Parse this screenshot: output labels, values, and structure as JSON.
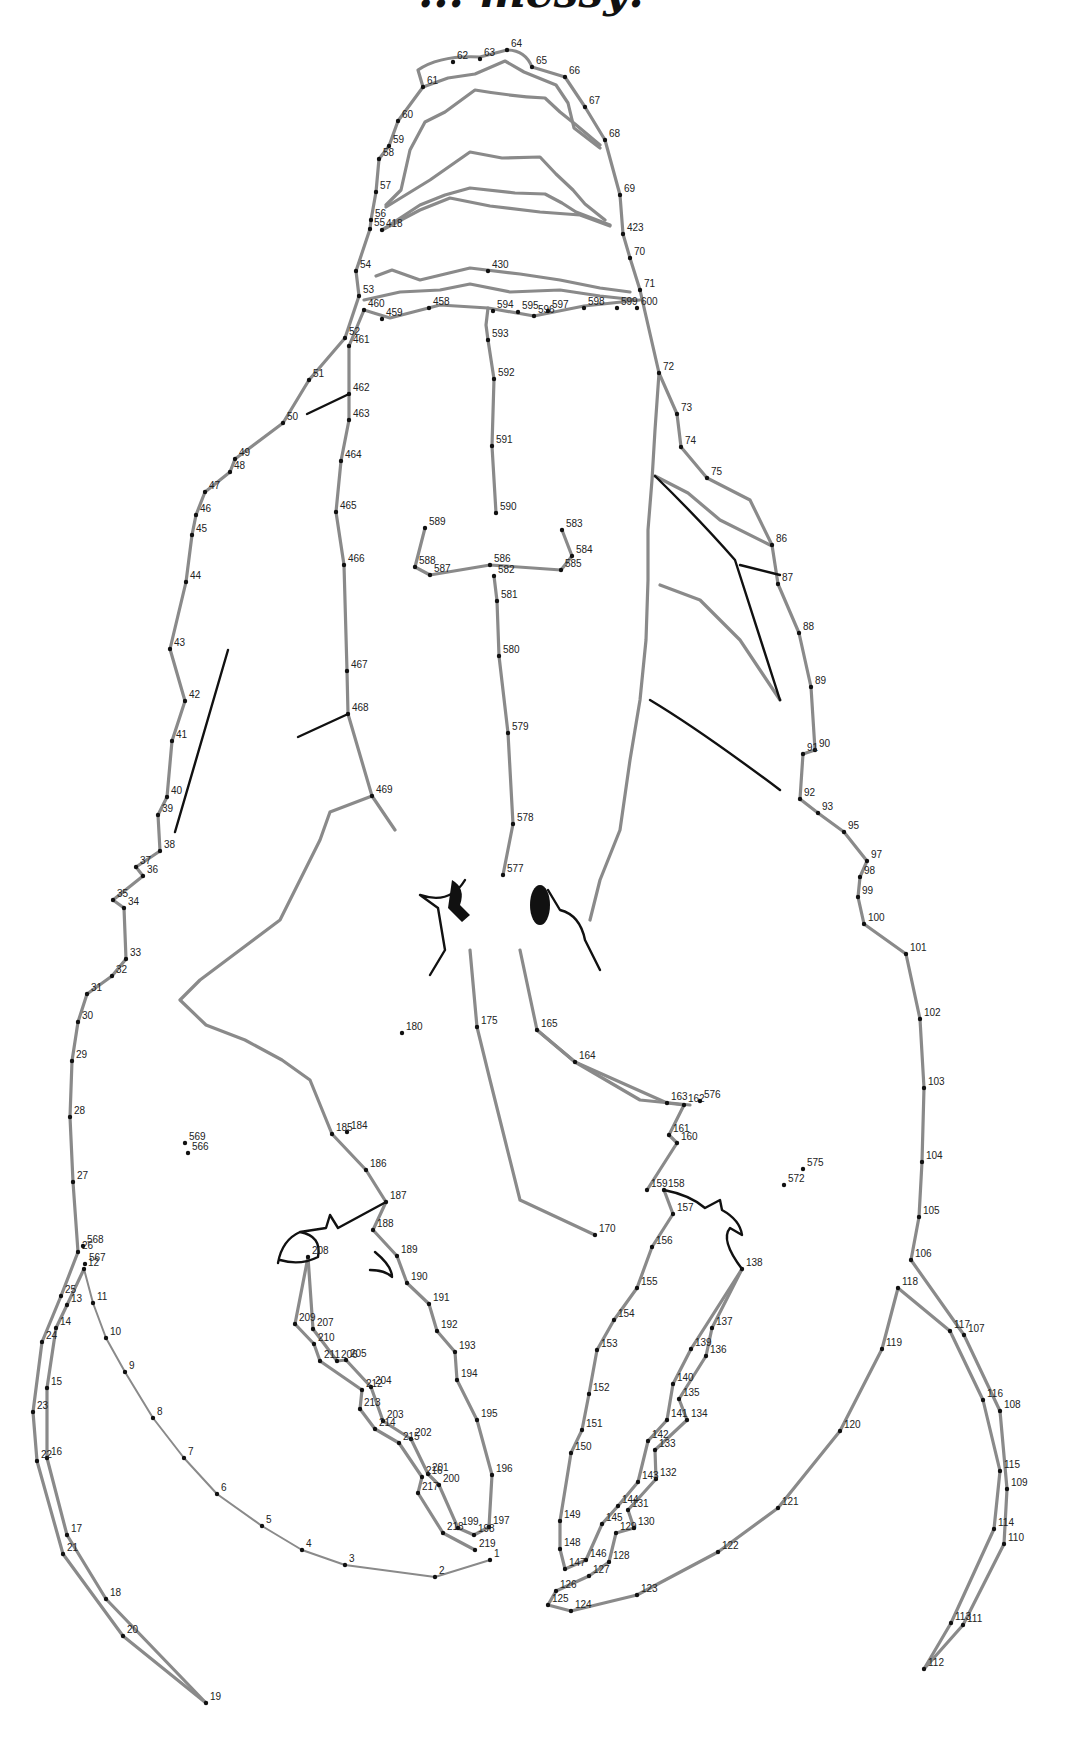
{
  "title": "... messy!",
  "colors": {
    "outline": "#8a8a8a",
    "ink": "#111111",
    "background": "#ffffff"
  },
  "dots": [
    {
      "n": "1",
      "x": 490,
      "y": 1560
    },
    {
      "n": "2",
      "x": 435,
      "y": 1577
    },
    {
      "n": "3",
      "x": 345,
      "y": 1565
    },
    {
      "n": "4",
      "x": 302,
      "y": 1550
    },
    {
      "n": "5",
      "x": 262,
      "y": 1526
    },
    {
      "n": "6",
      "x": 217,
      "y": 1494
    },
    {
      "n": "7",
      "x": 184,
      "y": 1458
    },
    {
      "n": "8",
      "x": 153,
      "y": 1418
    },
    {
      "n": "9",
      "x": 125,
      "y": 1372
    },
    {
      "n": "10",
      "x": 106,
      "y": 1338
    },
    {
      "n": "11",
      "x": 93,
      "y": 1303
    },
    {
      "n": "12",
      "x": 84,
      "y": 1269
    },
    {
      "n": "13",
      "x": 67,
      "y": 1305
    },
    {
      "n": "14",
      "x": 56,
      "y": 1328
    },
    {
      "n": "15",
      "x": 47,
      "y": 1388
    },
    {
      "n": "16",
      "x": 47,
      "y": 1458
    },
    {
      "n": "17",
      "x": 67,
      "y": 1535
    },
    {
      "n": "18",
      "x": 106,
      "y": 1599
    },
    {
      "n": "19",
      "x": 206,
      "y": 1703
    },
    {
      "n": "20",
      "x": 123,
      "y": 1636
    },
    {
      "n": "21",
      "x": 63,
      "y": 1554
    },
    {
      "n": "22",
      "x": 37,
      "y": 1461
    },
    {
      "n": "23",
      "x": 33,
      "y": 1412
    },
    {
      "n": "24",
      "x": 42,
      "y": 1342
    },
    {
      "n": "25",
      "x": 61,
      "y": 1296
    },
    {
      "n": "26",
      "x": 78,
      "y": 1252
    },
    {
      "n": "27",
      "x": 73,
      "y": 1182
    },
    {
      "n": "28",
      "x": 70,
      "y": 1117
    },
    {
      "n": "29",
      "x": 72,
      "y": 1061
    },
    {
      "n": "30",
      "x": 78,
      "y": 1022
    },
    {
      "n": "31",
      "x": 87,
      "y": 994
    },
    {
      "n": "32",
      "x": 112,
      "y": 976
    },
    {
      "n": "33",
      "x": 126,
      "y": 959
    },
    {
      "n": "34",
      "x": 124,
      "y": 908
    },
    {
      "n": "35",
      "x": 113,
      "y": 900
    },
    {
      "n": "36",
      "x": 143,
      "y": 876
    },
    {
      "n": "37",
      "x": 136,
      "y": 867
    },
    {
      "n": "38",
      "x": 160,
      "y": 851
    },
    {
      "n": "39",
      "x": 158,
      "y": 815
    },
    {
      "n": "40",
      "x": 167,
      "y": 797
    },
    {
      "n": "41",
      "x": 172,
      "y": 741
    },
    {
      "n": "42",
      "x": 185,
      "y": 701
    },
    {
      "n": "43",
      "x": 170,
      "y": 649
    },
    {
      "n": "44",
      "x": 186,
      "y": 582
    },
    {
      "n": "45",
      "x": 192,
      "y": 535
    },
    {
      "n": "46",
      "x": 196,
      "y": 515
    },
    {
      "n": "47",
      "x": 205,
      "y": 492
    },
    {
      "n": "48",
      "x": 230,
      "y": 472
    },
    {
      "n": "49",
      "x": 235,
      "y": 459
    },
    {
      "n": "50",
      "x": 283,
      "y": 423
    },
    {
      "n": "51",
      "x": 309,
      "y": 380
    },
    {
      "n": "52",
      "x": 345,
      "y": 338
    },
    {
      "n": "53",
      "x": 359,
      "y": 296
    },
    {
      "n": "54",
      "x": 356,
      "y": 271
    },
    {
      "n": "55",
      "x": 370,
      "y": 229
    },
    {
      "n": "56",
      "x": 371,
      "y": 220
    },
    {
      "n": "57",
      "x": 376,
      "y": 192
    },
    {
      "n": "58",
      "x": 379,
      "y": 159
    },
    {
      "n": "59",
      "x": 389,
      "y": 146
    },
    {
      "n": "60",
      "x": 398,
      "y": 121
    },
    {
      "n": "61",
      "x": 423,
      "y": 87
    },
    {
      "n": "62",
      "x": 453,
      "y": 62
    },
    {
      "n": "63",
      "x": 480,
      "y": 59
    },
    {
      "n": "64",
      "x": 507,
      "y": 50
    },
    {
      "n": "65",
      "x": 532,
      "y": 67
    },
    {
      "n": "66",
      "x": 565,
      "y": 77
    },
    {
      "n": "67",
      "x": 585,
      "y": 107
    },
    {
      "n": "68",
      "x": 605,
      "y": 140
    },
    {
      "n": "69",
      "x": 620,
      "y": 195
    },
    {
      "n": "70",
      "x": 630,
      "y": 258
    },
    {
      "n": "71",
      "x": 640,
      "y": 290
    },
    {
      "n": "72",
      "x": 659,
      "y": 373
    },
    {
      "n": "73",
      "x": 677,
      "y": 414
    },
    {
      "n": "74",
      "x": 681,
      "y": 447
    },
    {
      "n": "75",
      "x": 707,
      "y": 478
    },
    {
      "n": "86",
      "x": 772,
      "y": 545
    },
    {
      "n": "87",
      "x": 778,
      "y": 584
    },
    {
      "n": "88",
      "x": 799,
      "y": 633
    },
    {
      "n": "89",
      "x": 811,
      "y": 687
    },
    {
      "n": "90",
      "x": 815,
      "y": 750
    },
    {
      "n": "91",
      "x": 803,
      "y": 754
    },
    {
      "n": "92",
      "x": 800,
      "y": 799
    },
    {
      "n": "93",
      "x": 818,
      "y": 813
    },
    {
      "n": "95",
      "x": 844,
      "y": 832
    },
    {
      "n": "97",
      "x": 867,
      "y": 861
    },
    {
      "n": "98",
      "x": 860,
      "y": 877
    },
    {
      "n": "99",
      "x": 858,
      "y": 897
    },
    {
      "n": "100",
      "x": 864,
      "y": 924
    },
    {
      "n": "101",
      "x": 906,
      "y": 954
    },
    {
      "n": "102",
      "x": 920,
      "y": 1019
    },
    {
      "n": "103",
      "x": 924,
      "y": 1088
    },
    {
      "n": "104",
      "x": 922,
      "y": 1162
    },
    {
      "n": "105",
      "x": 919,
      "y": 1217
    },
    {
      "n": "106",
      "x": 911,
      "y": 1260
    },
    {
      "n": "107",
      "x": 964,
      "y": 1335
    },
    {
      "n": "108",
      "x": 1000,
      "y": 1411
    },
    {
      "n": "109",
      "x": 1007,
      "y": 1489
    },
    {
      "n": "110",
      "x": 1004,
      "y": 1544
    },
    {
      "n": "111",
      "x": 963,
      "y": 1625
    },
    {
      "n": "112",
      "x": 924,
      "y": 1669
    },
    {
      "n": "113",
      "x": 951,
      "y": 1623
    },
    {
      "n": "114",
      "x": 994,
      "y": 1529
    },
    {
      "n": "115",
      "x": 1000,
      "y": 1471
    },
    {
      "n": "116",
      "x": 983,
      "y": 1400
    },
    {
      "n": "117",
      "x": 950,
      "y": 1331
    },
    {
      "n": "118",
      "x": 898,
      "y": 1288
    },
    {
      "n": "119",
      "x": 882,
      "y": 1349
    },
    {
      "n": "120",
      "x": 840,
      "y": 1431
    },
    {
      "n": "121",
      "x": 778,
      "y": 1508
    },
    {
      "n": "122",
      "x": 718,
      "y": 1552
    },
    {
      "n": "123",
      "x": 637,
      "y": 1595
    },
    {
      "n": "124",
      "x": 571,
      "y": 1611
    },
    {
      "n": "125",
      "x": 548,
      "y": 1605
    },
    {
      "n": "126",
      "x": 556,
      "y": 1591
    },
    {
      "n": "127",
      "x": 589,
      "y": 1576
    },
    {
      "n": "128",
      "x": 609,
      "y": 1562
    },
    {
      "n": "129",
      "x": 616,
      "y": 1533
    },
    {
      "n": "130",
      "x": 634,
      "y": 1528
    },
    {
      "n": "131",
      "x": 628,
      "y": 1510
    },
    {
      "n": "132",
      "x": 656,
      "y": 1479
    },
    {
      "n": "133",
      "x": 655,
      "y": 1450
    },
    {
      "n": "134",
      "x": 687,
      "y": 1420
    },
    {
      "n": "135",
      "x": 679,
      "y": 1399
    },
    {
      "n": "136",
      "x": 706,
      "y": 1356
    },
    {
      "n": "137",
      "x": 712,
      "y": 1328
    },
    {
      "n": "138",
      "x": 742,
      "y": 1269
    },
    {
      "n": "139",
      "x": 691,
      "y": 1349
    },
    {
      "n": "140",
      "x": 673,
      "y": 1384
    },
    {
      "n": "141",
      "x": 667,
      "y": 1420
    },
    {
      "n": "142",
      "x": 648,
      "y": 1441
    },
    {
      "n": "143",
      "x": 638,
      "y": 1482
    },
    {
      "n": "144",
      "x": 618,
      "y": 1506
    },
    {
      "n": "145",
      "x": 602,
      "y": 1524
    },
    {
      "n": "146",
      "x": 586,
      "y": 1560
    },
    {
      "n": "147",
      "x": 565,
      "y": 1569
    },
    {
      "n": "148",
      "x": 560,
      "y": 1549
    },
    {
      "n": "149",
      "x": 560,
      "y": 1521
    },
    {
      "n": "150",
      "x": 571,
      "y": 1453
    },
    {
      "n": "151",
      "x": 582,
      "y": 1430
    },
    {
      "n": "152",
      "x": 589,
      "y": 1394
    },
    {
      "n": "153",
      "x": 597,
      "y": 1350
    },
    {
      "n": "154",
      "x": 614,
      "y": 1320
    },
    {
      "n": "155",
      "x": 637,
      "y": 1288
    },
    {
      "n": "156",
      "x": 652,
      "y": 1247
    },
    {
      "n": "157",
      "x": 673,
      "y": 1214
    },
    {
      "n": "158",
      "x": 664,
      "y": 1190
    },
    {
      "n": "159",
      "x": 647,
      "y": 1190
    },
    {
      "n": "160",
      "x": 677,
      "y": 1143
    },
    {
      "n": "161",
      "x": 669,
      "y": 1135
    },
    {
      "n": "162",
      "x": 684,
      "y": 1105
    },
    {
      "n": "163",
      "x": 667,
      "y": 1103
    },
    {
      "n": "164",
      "x": 575,
      "y": 1062
    },
    {
      "n": "165",
      "x": 537,
      "y": 1030
    },
    {
      "n": "170",
      "x": 595,
      "y": 1235
    },
    {
      "n": "175",
      "x": 477,
      "y": 1027
    },
    {
      "n": "180",
      "x": 402,
      "y": 1033
    },
    {
      "n": "184",
      "x": 347,
      "y": 1132
    },
    {
      "n": "185",
      "x": 332,
      "y": 1134
    },
    {
      "n": "186",
      "x": 366,
      "y": 1170
    },
    {
      "n": "187",
      "x": 386,
      "y": 1202
    },
    {
      "n": "188",
      "x": 373,
      "y": 1230
    },
    {
      "n": "189",
      "x": 397,
      "y": 1256
    },
    {
      "n": "190",
      "x": 407,
      "y": 1283
    },
    {
      "n": "191",
      "x": 429,
      "y": 1304
    },
    {
      "n": "192",
      "x": 437,
      "y": 1331
    },
    {
      "n": "193",
      "x": 455,
      "y": 1352
    },
    {
      "n": "194",
      "x": 457,
      "y": 1380
    },
    {
      "n": "195",
      "x": 477,
      "y": 1420
    },
    {
      "n": "196",
      "x": 492,
      "y": 1475
    },
    {
      "n": "197",
      "x": 489,
      "y": 1527
    },
    {
      "n": "198",
      "x": 474,
      "y": 1535
    },
    {
      "n": "199",
      "x": 458,
      "y": 1528
    },
    {
      "n": "200",
      "x": 439,
      "y": 1485
    },
    {
      "n": "201",
      "x": 428,
      "y": 1474
    },
    {
      "n": "202",
      "x": 411,
      "y": 1439
    },
    {
      "n": "203",
      "x": 383,
      "y": 1421
    },
    {
      "n": "204",
      "x": 371,
      "y": 1387
    },
    {
      "n": "205",
      "x": 346,
      "y": 1360
    },
    {
      "n": "206",
      "x": 337,
      "y": 1361
    },
    {
      "n": "207",
      "x": 313,
      "y": 1329
    },
    {
      "n": "208",
      "x": 308,
      "y": 1257
    },
    {
      "n": "209",
      "x": 295,
      "y": 1324
    },
    {
      "n": "210",
      "x": 314,
      "y": 1344
    },
    {
      "n": "211",
      "x": 320,
      "y": 1361
    },
    {
      "n": "212",
      "x": 362,
      "y": 1390
    },
    {
      "n": "213",
      "x": 360,
      "y": 1409
    },
    {
      "n": "214",
      "x": 375,
      "y": 1429
    },
    {
      "n": "215",
      "x": 399,
      "y": 1443
    },
    {
      "n": "216",
      "x": 422,
      "y": 1477
    },
    {
      "n": "217",
      "x": 418,
      "y": 1493
    },
    {
      "n": "218",
      "x": 443,
      "y": 1533
    },
    {
      "n": "219",
      "x": 475,
      "y": 1550
    },
    {
      "n": "418",
      "x": 382,
      "y": 230
    },
    {
      "n": "423",
      "x": 623,
      "y": 234
    },
    {
      "n": "430",
      "x": 488,
      "y": 271
    },
    {
      "n": "458",
      "x": 429,
      "y": 308
    },
    {
      "n": "459",
      "x": 382,
      "y": 319
    },
    {
      "n": "460",
      "x": 364,
      "y": 310
    },
    {
      "n": "461",
      "x": 349,
      "y": 346
    },
    {
      "n": "462",
      "x": 349,
      "y": 394
    },
    {
      "n": "463",
      "x": 349,
      "y": 420
    },
    {
      "n": "464",
      "x": 341,
      "y": 461
    },
    {
      "n": "465",
      "x": 336,
      "y": 512
    },
    {
      "n": "466",
      "x": 344,
      "y": 565
    },
    {
      "n": "467",
      "x": 347,
      "y": 671
    },
    {
      "n": "468",
      "x": 348,
      "y": 714
    },
    {
      "n": "469",
      "x": 372,
      "y": 796
    },
    {
      "n": "566",
      "x": 188,
      "y": 1153
    },
    {
      "n": "567",
      "x": 85,
      "y": 1264
    },
    {
      "n": "568",
      "x": 83,
      "y": 1246
    },
    {
      "n": "569",
      "x": 185,
      "y": 1143
    },
    {
      "n": "572",
      "x": 784,
      "y": 1185
    },
    {
      "n": "575",
      "x": 803,
      "y": 1169
    },
    {
      "n": "576",
      "x": 700,
      "y": 1101
    },
    {
      "n": "577",
      "x": 503,
      "y": 875
    },
    {
      "n": "578",
      "x": 513,
      "y": 824
    },
    {
      "n": "579",
      "x": 508,
      "y": 733
    },
    {
      "n": "580",
      "x": 499,
      "y": 656
    },
    {
      "n": "581",
      "x": 497,
      "y": 601
    },
    {
      "n": "582",
      "x": 494,
      "y": 576
    },
    {
      "n": "583",
      "x": 562,
      "y": 530
    },
    {
      "n": "584",
      "x": 572,
      "y": 556
    },
    {
      "n": "585",
      "x": 561,
      "y": 570
    },
    {
      "n": "586",
      "x": 490,
      "y": 565
    },
    {
      "n": "587",
      "x": 430,
      "y": 575
    },
    {
      "n": "588",
      "x": 415,
      "y": 567
    },
    {
      "n": "589",
      "x": 425,
      "y": 528
    },
    {
      "n": "590",
      "x": 496,
      "y": 513
    },
    {
      "n": "591",
      "x": 492,
      "y": 446
    },
    {
      "n": "592",
      "x": 494,
      "y": 379
    },
    {
      "n": "593",
      "x": 488,
      "y": 340
    },
    {
      "n": "594",
      "x": 493,
      "y": 311
    },
    {
      "n": "595",
      "x": 518,
      "y": 312
    },
    {
      "n": "596",
      "x": 534,
      "y": 316
    },
    {
      "n": "597",
      "x": 548,
      "y": 311
    },
    {
      "n": "598",
      "x": 584,
      "y": 308
    },
    {
      "n": "599",
      "x": 617,
      "y": 308
    },
    {
      "n": "600",
      "x": 637,
      "y": 308
    }
  ]
}
